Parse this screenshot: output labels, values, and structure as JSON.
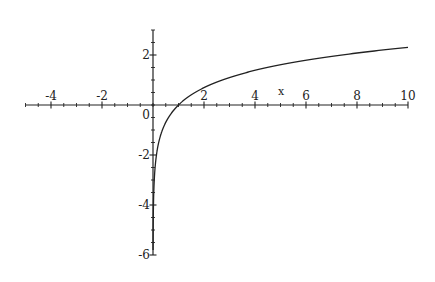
{
  "chart_data": {
    "type": "line",
    "title": "",
    "function": "y = ln(x)",
    "xlabel": "x",
    "ylabel": "",
    "xlim": [
      -5,
      10
    ],
    "ylim": [
      -6,
      3
    ],
    "grid": false,
    "legend": null,
    "x_ticks": [
      -4,
      -2,
      2,
      4,
      6,
      8,
      10
    ],
    "x_tick_labels": [
      "-4",
      "-2",
      "2",
      "4",
      "6",
      "8",
      "10"
    ],
    "y_ticks": [
      2,
      -2,
      -4,
      -6
    ],
    "y_tick_labels": [
      "2",
      "-2",
      "-4",
      "-6"
    ],
    "origin_label": "0",
    "series": [
      {
        "name": "ln(x)",
        "x": [
          0.003,
          0.01,
          0.05,
          0.1,
          0.2,
          0.5,
          1,
          2,
          3,
          4,
          5,
          6,
          7,
          8,
          9,
          10
        ],
        "values": [
          -5.81,
          -4.61,
          -3.0,
          -2.3,
          -1.61,
          -0.69,
          0,
          0.69,
          1.1,
          1.39,
          1.61,
          1.79,
          1.95,
          2.08,
          2.2,
          2.3
        ]
      }
    ]
  },
  "colors": {
    "axis": "#222222",
    "curve": "#222222",
    "background": "#ffffff"
  }
}
